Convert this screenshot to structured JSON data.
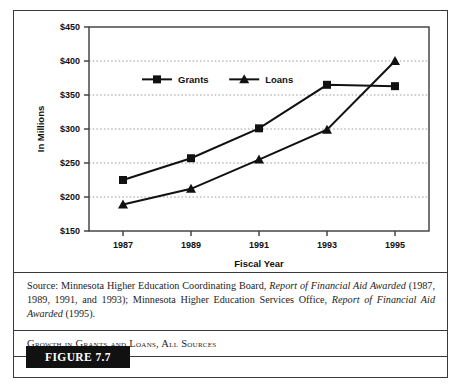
{
  "figure": {
    "badge_label": "FIGURE 7.7",
    "caption": "Growth in Grants and Loans, All Sources",
    "source_prefix": "Source: Minnesota Higher Education Coordinating Board, ",
    "source_italic_1": "Report of Financial Aid Awarded",
    "source_middle": " (1987, 1989, 1991, and 1993); Minnesota Higher Education Services Office, ",
    "source_italic_2": "Report of Financial Aid Awarded",
    "source_suffix": " (1995)."
  },
  "chart_data": {
    "type": "line",
    "title": "",
    "xlabel": "Fiscal Year",
    "ylabel": "In Millions",
    "categories": [
      "1987",
      "1989",
      "1991",
      "1993",
      "1995"
    ],
    "series": [
      {
        "name": "Grants",
        "marker": "square",
        "values": [
          225,
          257,
          301,
          365,
          363
        ]
      },
      {
        "name": "Loans",
        "marker": "triangle",
        "values": [
          189,
          212,
          255,
          299,
          400
        ]
      }
    ],
    "ylim": [
      150,
      450
    ],
    "ytick_values": [
      150,
      200,
      250,
      300,
      350,
      400,
      450
    ],
    "ytick_labels": [
      "$150",
      "$200",
      "$250",
      "$300",
      "$350",
      "$400",
      "$450"
    ],
    "grid": "horizontal-dotted",
    "legend_position": "inside-top-left",
    "line_color": "#111111",
    "grid_color": "#999999",
    "axis_color": "#3a3a3a"
  }
}
